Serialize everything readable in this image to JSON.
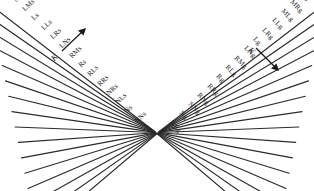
{
  "figure": {
    "background_color": "#ffffff",
    "line_color": "#2b2b2b",
    "text_color": "#1c1c1c"
  },
  "axes": [
    {
      "name": "left-axis",
      "label": "K",
      "direction": "up-right"
    },
    {
      "name": "right-axis",
      "label": "K",
      "direction": "down-right"
    }
  ],
  "left_labels": [
    "MLs",
    "Ms",
    "MNs",
    "LMs",
    "Ls",
    "LLs",
    "LRs",
    "LNs",
    "RMs",
    "Rs",
    "RLs",
    "RRs",
    "NRs",
    "NLs",
    "Ns",
    "NNs"
  ],
  "right_labels": [
    "MNg",
    "Mg",
    "MRg",
    "MLg",
    "LLg",
    "LRg",
    "Lg",
    "LNg",
    "RMg",
    "RLg",
    "Rg",
    "RRg",
    "RNg",
    "NNg",
    "Ng",
    "NRg"
  ],
  "chart_data": {
    "type": "diagram",
    "families": [
      {
        "name": "left-family",
        "suffix": "s",
        "count": 16,
        "orientation": "down-right",
        "labels": [
          "MLs",
          "Ms",
          "MNs",
          "LMs",
          "Ls",
          "LLs",
          "LRs",
          "LNs",
          "RMs",
          "Rs",
          "RLs",
          "RRs",
          "NRs",
          "NLs",
          "Ns",
          "NNs"
        ]
      },
      {
        "name": "right-family",
        "suffix": "g",
        "count": 16,
        "orientation": "down-left",
        "labels": [
          "MNg",
          "Mg",
          "MRg",
          "MLg",
          "LLg",
          "LRg",
          "Lg",
          "LNg",
          "RMg",
          "RLg",
          "Rg",
          "RRg",
          "RNg",
          "NNg",
          "Ng",
          "NRg"
        ]
      }
    ],
    "annotations": [
      {
        "text": "K",
        "position": "left",
        "arrow": "up-right"
      },
      {
        "text": "K",
        "position": "right",
        "arrow": "down-right"
      }
    ],
    "grid": true,
    "legend": "none"
  }
}
